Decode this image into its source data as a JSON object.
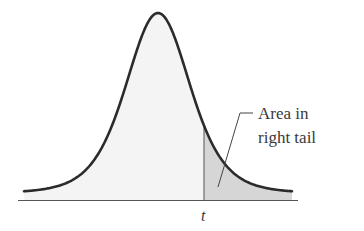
{
  "chart_data": {
    "type": "area",
    "title": "",
    "xlabel": "",
    "ylabel": "",
    "x_tick_labels": [
      "t"
    ],
    "annotations": [
      {
        "text_lines": [
          "Area in",
          "right tail"
        ],
        "points_to": "shaded region right of t"
      }
    ],
    "shaded_region": {
      "from": "t",
      "to": "+inf",
      "label": "Area in right tail"
    },
    "grid": false,
    "legend": null,
    "colors": {
      "curve": "#2b2b2b",
      "body_fill": "#f4f4f4",
      "tail_fill": "#d6d6d6",
      "axis": "#555555"
    }
  },
  "labels": {
    "t_marker": "t",
    "annotation_line1": "Area in",
    "annotation_line2": "right tail"
  }
}
